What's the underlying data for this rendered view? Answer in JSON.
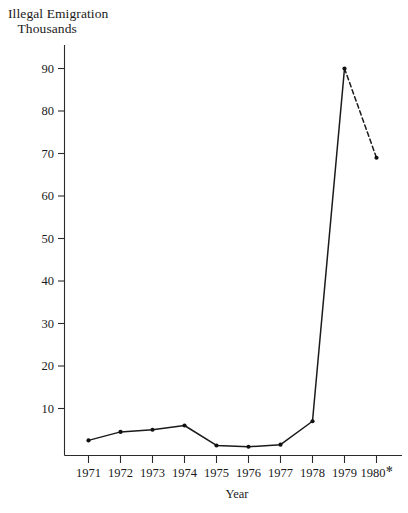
{
  "chart_data": {
    "type": "line",
    "title": "Illegal Emigration",
    "subtitle": "Thousands",
    "xlabel": "Year",
    "ylabel": "",
    "categories": [
      "1971",
      "1972",
      "1973",
      "1974",
      "1975",
      "1976",
      "1977",
      "1978",
      "1979",
      "1980"
    ],
    "x_tick_labels": [
      "1971",
      "1972",
      "1973",
      "1974",
      "1975",
      "1976",
      "1977",
      "1978",
      "1979",
      "1980"
    ],
    "x_last_label_marker": "✻",
    "y_tick_labels": [
      "10",
      "20",
      "30",
      "40",
      "50",
      "60",
      "70",
      "80",
      "90"
    ],
    "y_ticks": [
      10,
      20,
      30,
      40,
      50,
      60,
      70,
      80,
      90
    ],
    "ylim": [
      0,
      95
    ],
    "values": [
      2.5,
      4.5,
      5.0,
      6.0,
      1.3,
      1.0,
      1.5,
      7.0,
      90.0,
      69.0
    ],
    "series": [
      {
        "name": "Illegal Emigration",
        "values": [
          2.5,
          4.5,
          5.0,
          6.0,
          1.3,
          1.0,
          1.5,
          7.0,
          90.0,
          69.0
        ],
        "solid_through_index": 8,
        "dashed_from_index": 8
      }
    ],
    "grid": false,
    "legend": false,
    "legend_position": "none",
    "line_color": "#1a1a1a",
    "marker": "dot",
    "dashed_tail_note": "segment from 1979 to 1980 is dashed (provisional)"
  },
  "colors": {
    "ink": "#1a1a1a",
    "axis": "#2b2b2b",
    "background": "#ffffff"
  }
}
